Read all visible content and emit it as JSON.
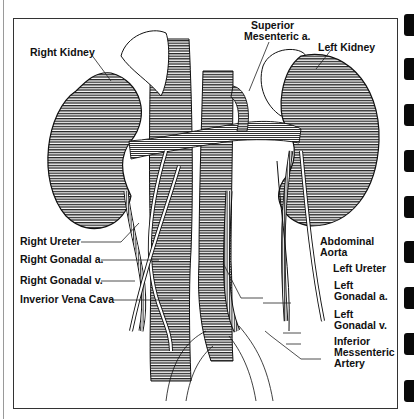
{
  "figure": {
    "labels": {
      "right_kidney": "Right Kidney",
      "superior_mesenteric": [
        "Superior",
        "Mesenteric a."
      ],
      "left_kidney": "Left Kidney",
      "right_ureter": "Right Ureter",
      "right_gonadal_a": "Right Gonadal a.",
      "right_gonadal_v": "Right Gonadal v.",
      "inferior_vena_cava": "Inverior Vena Cava",
      "abdominal_aorta": [
        "Abdominal",
        "Aorta"
      ],
      "left_ureter": "Left Ureter",
      "left_gonadal_a": [
        "Left",
        "Gonadal a."
      ],
      "left_gonadal_v": [
        "Left",
        "Gonadal v."
      ],
      "inferior_mesenteric_artery": [
        "Inferior",
        "Messenteric",
        "Artery"
      ]
    },
    "colors": {
      "ink": "#111111",
      "paper": "#ffffff",
      "frame": "#333333",
      "tab": "#0a0a0a"
    }
  },
  "page_tabs": {
    "count": 9
  }
}
